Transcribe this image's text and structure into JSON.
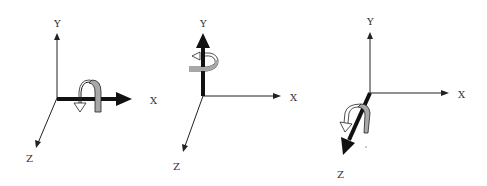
{
  "diagram": {
    "panels": [
      {
        "id": "rotation-x",
        "rotation_axis": "X",
        "labels": {
          "y": "Y",
          "x": "X",
          "z": "Z"
        }
      },
      {
        "id": "rotation-y",
        "rotation_axis": "Y",
        "labels": {
          "y": "Y",
          "x": "X",
          "z": "Z"
        }
      },
      {
        "id": "rotation-z",
        "rotation_axis": "Z",
        "labels": {
          "y": "Y",
          "x": "X",
          "z": "Z"
        }
      }
    ],
    "colors": {
      "axis": "#222222",
      "highlighted_axis": "#111111",
      "rotation_arrow_fill": "#a8a8a8",
      "rotation_arrow_light": "#ffffff",
      "label": "#333333"
    }
  }
}
